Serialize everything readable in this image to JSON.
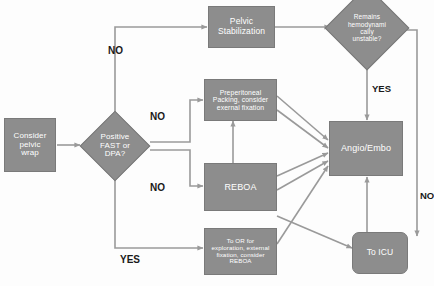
{
  "diagram": {
    "colors": {
      "node_fill": "#8d8d8d",
      "node_border": "#7a7a7a",
      "node_text": "#ffffff",
      "connector": "#9a9a9a",
      "label_text": "#1a1a1a",
      "background": "#fdfdfd"
    },
    "nodes": [
      {
        "id": "consider-pelvic-wrap",
        "shape": "rect",
        "lines": [
          "Consider",
          "pelvic",
          "wrap"
        ]
      },
      {
        "id": "positive-fast-or-dpa",
        "shape": "diamond",
        "lines": [
          "Positive",
          "FAST or",
          "DPA?"
        ]
      },
      {
        "id": "pelvic-stabilization",
        "shape": "rect",
        "lines": [
          "Pelvic",
          "Stabilization"
        ]
      },
      {
        "id": "remains-hemodynamically-unstable",
        "shape": "diamond",
        "lines": [
          "Remains",
          "hemodynami",
          "cally",
          "unstable?"
        ]
      },
      {
        "id": "preperitoneal-packing",
        "shape": "rect",
        "lines": [
          "Preperitoneal",
          "Packing, consider",
          "exernal fixation"
        ]
      },
      {
        "id": "reboa",
        "shape": "rect",
        "lines": [
          "REBOA"
        ]
      },
      {
        "id": "angio-embo",
        "shape": "rect",
        "lines": [
          "Angio/Embo"
        ]
      },
      {
        "id": "to-or",
        "shape": "rect",
        "lines": [
          "To OR for",
          "exploration, external",
          "fixation, consider",
          "REBOA"
        ]
      },
      {
        "id": "to-icu",
        "shape": "rounded-rect",
        "lines": [
          "To ICU"
        ]
      }
    ],
    "edge_labels": {
      "no_to_stabilization": "NO",
      "no_to_packing": "NO",
      "no_to_reboa": "NO",
      "yes_to_angio": "YES",
      "no_to_icu": "NO",
      "yes_to_or": "YES"
    }
  }
}
